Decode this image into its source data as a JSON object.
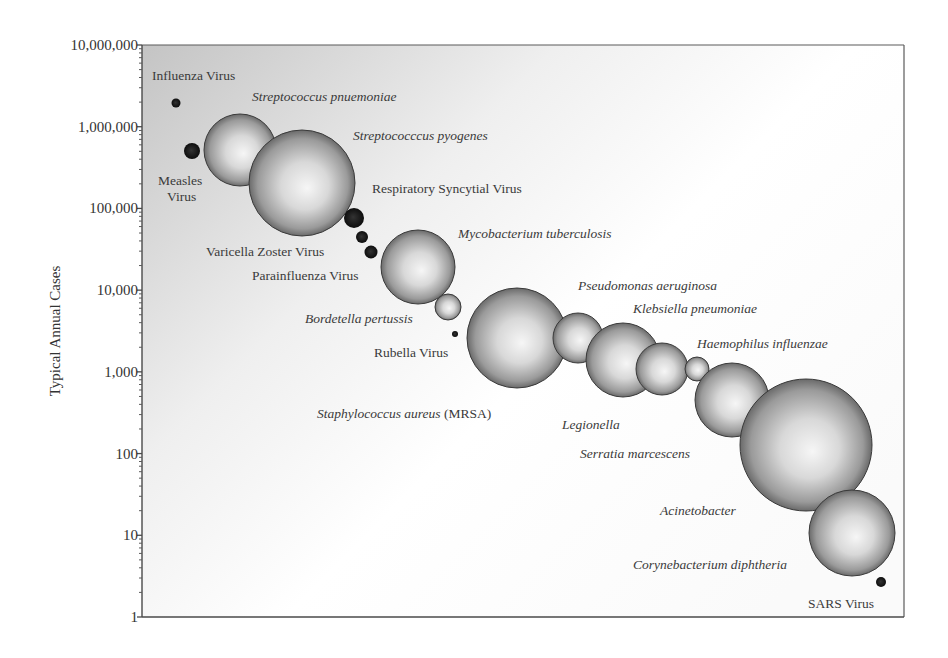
{
  "chart_data": {
    "type": "scatter",
    "subtype": "bubble",
    "title": "",
    "xlabel": "",
    "ylabel": "Typical Annual Cases",
    "yscale": "log",
    "ylim": [
      1,
      10000000
    ],
    "y_ticks": [
      {
        "value": 10000000,
        "label": "10,000,000"
      },
      {
        "value": 1000000,
        "label": "1,000,000"
      },
      {
        "value": 100000,
        "label": "100,000"
      },
      {
        "value": 10000,
        "label": "10,000"
      },
      {
        "value": 1000,
        "label": "1,000"
      },
      {
        "value": 100,
        "label": "100"
      },
      {
        "value": 10,
        "label": "10"
      },
      {
        "value": 1,
        "label": "1"
      }
    ],
    "grid": false,
    "legend": null,
    "colors": {
      "virus_fill": "#1a1a1a",
      "bacteria_fill_light": "#f4f4f4",
      "bacteria_fill_dark": "#6e6e6e",
      "bubble_stroke": "#3a3a3a",
      "plot_bg_dark": "#c9c9c9",
      "plot_bg_light": "#ffffff",
      "axis": "#555555"
    },
    "points": [
      {
        "name": "Influenza Virus",
        "kind": "virus",
        "italic": false,
        "cases": 2000000,
        "cx": 176,
        "cy": 103,
        "r": 4.5,
        "label_lines": [
          "Influenza Virus"
        ],
        "lx": 152,
        "ly": 80
      },
      {
        "name": "Measles Virus",
        "kind": "virus",
        "italic": false,
        "cases": 500000,
        "cx": 192,
        "cy": 151,
        "r": 8,
        "label_lines": [
          "Measles",
          "Virus"
        ],
        "lx": 158,
        "ly": 185,
        "lx2": 167,
        "ly2": 201
      },
      {
        "name": "Streptococcus pnuemoniae",
        "kind": "bacteria",
        "italic": true,
        "cases": 500000,
        "cx": 240,
        "cy": 150,
        "r": 36,
        "label_lines": [
          "Streptococcus pnuemoniae"
        ],
        "lx": 252,
        "ly": 101
      },
      {
        "name": "Streptococccus pyogenes",
        "kind": "bacteria",
        "italic": true,
        "cases": 200000,
        "cx": 302,
        "cy": 183,
        "r": 53,
        "label_lines": [
          "Streptococccus pyogenes"
        ],
        "lx": 353,
        "ly": 140
      },
      {
        "name": "Respiratory Syncytial Virus",
        "kind": "virus",
        "italic": false,
        "cases": 75000,
        "cx": 354,
        "cy": 218,
        "r": 10,
        "label_lines": [
          "Respiratory Syncytial Virus"
        ],
        "lx": 372,
        "ly": 193
      },
      {
        "name": "Varicella Zoster Virus",
        "kind": "virus",
        "italic": false,
        "cases": 45000,
        "cx": 362,
        "cy": 237,
        "r": 6,
        "label_lines": [
          "Varicella Zoster Virus"
        ],
        "lx": 206,
        "ly": 256
      },
      {
        "name": "Parainfluenza Virus",
        "kind": "virus",
        "italic": false,
        "cases": 30000,
        "cx": 371,
        "cy": 252,
        "r": 6.5,
        "label_lines": [
          "Parainfluenza Virus"
        ],
        "lx": 252,
        "ly": 280
      },
      {
        "name": "Mycobacterium tuberculosis",
        "kind": "bacteria",
        "italic": true,
        "cases": 19000,
        "cx": 418,
        "cy": 267,
        "r": 37,
        "label_lines": [
          "Mycobacterium tuberculosis"
        ],
        "lx": 458,
        "ly": 238
      },
      {
        "name": "Bordetella pertussis",
        "kind": "bacteria",
        "italic": true,
        "cases": 6000,
        "cx": 448,
        "cy": 307,
        "r": 13,
        "label_lines": [
          "Bordetella pertussis"
        ],
        "lx": 305,
        "ly": 323
      },
      {
        "name": "Rubella Virus",
        "kind": "virus",
        "italic": false,
        "cases": 3000,
        "cx": 455,
        "cy": 334,
        "r": 3,
        "label_lines": [
          "Rubella Virus"
        ],
        "lx": 374,
        "ly": 357
      },
      {
        "name": "Staphylococcus aureus (MRSA)",
        "kind": "bacteria",
        "italic": true,
        "cases": 2600,
        "cx": 517,
        "cy": 338,
        "r": 50,
        "label_lines": [
          "Staphylococcus aureus"
        ],
        "label_suffix": " (MRSA)",
        "lx": 317,
        "ly": 418
      },
      {
        "name": "Pseudomonas aeruginosa",
        "kind": "bacteria",
        "italic": true,
        "cases": 2600,
        "cx": 578,
        "cy": 338,
        "r": 25,
        "label_lines": [
          "Pseudomonas aeruginosa"
        ],
        "lx": 578,
        "ly": 290
      },
      {
        "name": "Klebsiella pneumoniae",
        "kind": "bacteria",
        "italic": true,
        "cases": 1400,
        "cx": 623,
        "cy": 360,
        "r": 37,
        "label_lines": [
          "Klebsiella pneumoniae"
        ],
        "lx": 633,
        "ly": 313
      },
      {
        "name": "Legionella",
        "kind": "bacteria",
        "italic": true,
        "cases": 1100,
        "cx": 662,
        "cy": 369,
        "r": 26,
        "label_lines": [
          "Legionella"
        ],
        "lx": 562,
        "ly": 429
      },
      {
        "name": "Haemophilus influenzae",
        "kind": "bacteria",
        "italic": true,
        "cases": 1100,
        "cx": 697,
        "cy": 369,
        "r": 12,
        "label_lines": [
          "Haemophilus influenzae"
        ],
        "lx": 697,
        "ly": 348
      },
      {
        "name": "Serratia marcescens",
        "kind": "bacteria",
        "italic": true,
        "cases": 450,
        "cx": 732,
        "cy": 400,
        "r": 37,
        "label_lines": [
          "Serratia marcescens"
        ],
        "lx": 580,
        "ly": 458
      },
      {
        "name": "Acinetobacter",
        "kind": "bacteria",
        "italic": true,
        "cases": 130,
        "cx": 806,
        "cy": 445,
        "r": 66,
        "label_lines": [
          "Acinetobacter"
        ],
        "lx": 660,
        "ly": 515
      },
      {
        "name": "Corynebacterium diphtheria",
        "kind": "bacteria",
        "italic": true,
        "cases": 11,
        "cx": 852,
        "cy": 533,
        "r": 43,
        "label_lines": [
          "Corynebacterium diphtheria"
        ],
        "lx": 633,
        "ly": 569
      },
      {
        "name": "SARS Virus",
        "kind": "virus",
        "italic": false,
        "cases": 3,
        "cx": 881,
        "cy": 582,
        "r": 5,
        "label_lines": [
          "SARS Virus"
        ],
        "lx": 808,
        "ly": 608
      }
    ],
    "layout": {
      "plot_left": 142,
      "plot_right": 904,
      "plot_top": 45,
      "plot_bottom": 617
    }
  }
}
